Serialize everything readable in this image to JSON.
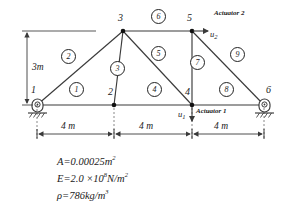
{
  "diagram": {
    "nodes": [
      {
        "id": "1",
        "label": "1",
        "x": 37,
        "y": 105,
        "support": "pin"
      },
      {
        "id": "2",
        "label": "2",
        "x": 114,
        "y": 105,
        "support": "none"
      },
      {
        "id": "3",
        "label": "3",
        "x": 123,
        "y": 31,
        "support": "none"
      },
      {
        "id": "4",
        "label": "4",
        "x": 192,
        "y": 105,
        "support": "none"
      },
      {
        "id": "5",
        "label": "5",
        "x": 192,
        "y": 31,
        "support": "none"
      },
      {
        "id": "6",
        "label": "6",
        "x": 264,
        "y": 105,
        "support": "roller"
      }
    ],
    "elements": [
      {
        "id": "1",
        "label": "1",
        "from": "1",
        "to": "2",
        "cx": 76,
        "cy": 89
      },
      {
        "id": "2",
        "label": "2",
        "from": "1",
        "to": "3",
        "cx": 68,
        "cy": 56
      },
      {
        "id": "3",
        "label": "3",
        "from": "2",
        "to": "3",
        "cx": 116,
        "cy": 68
      },
      {
        "id": "4",
        "label": "4",
        "from": "2",
        "to": "4",
        "cx": 154,
        "cy": 89
      },
      {
        "id": "5",
        "label": "5",
        "from": "3",
        "to": "4",
        "cx": 157,
        "cy": 53
      },
      {
        "id": "6",
        "label": "6",
        "from": "3",
        "to": "5",
        "cx": 157,
        "cy": 16
      },
      {
        "id": "7",
        "label": "7",
        "from": "4",
        "to": "5",
        "cx": 196,
        "cy": 62
      },
      {
        "id": "8",
        "label": "8",
        "from": "4",
        "to": "6",
        "cx": 226,
        "cy": 89
      },
      {
        "id": "9",
        "label": "9",
        "from": "5",
        "to": "6",
        "cx": 236,
        "cy": 54
      }
    ],
    "dimensions": {
      "height": {
        "label": "3m",
        "value": 3,
        "unit": "m"
      },
      "spans": [
        {
          "label": "4  m",
          "value": 4,
          "unit": "m"
        },
        {
          "label": "4  m",
          "value": 4,
          "unit": "m"
        },
        {
          "label": "4  m",
          "value": 4,
          "unit": "m"
        }
      ]
    },
    "actuators": [
      {
        "name": "Actuator 1",
        "label": "Actuator 1",
        "dof": "u",
        "dof_sub": "1",
        "node": "4",
        "direction": "down"
      },
      {
        "name": "Actuator 2",
        "label": "Actuator 2",
        "dof": "u",
        "dof_sub": "2",
        "node": "5",
        "direction": "right"
      }
    ],
    "properties": [
      {
        "symbol": "A",
        "eq": "=",
        "value": "0.00025",
        "unit": "m",
        "unit_exp": "2",
        "full": "A=0.00025m2"
      },
      {
        "symbol": "E",
        "eq": "=",
        "value": "2.0 ×10",
        "value_exp": "8",
        "unit": "N/m",
        "unit_exp": "2",
        "full": "E=2.0 x10^8 N/m2"
      },
      {
        "symbol": "ρ",
        "eq": "=",
        "value": "786",
        "unit": "kg/m",
        "unit_exp": "3",
        "full": "rho=786kg/m3"
      }
    ],
    "colors": {
      "line": "#3a3a3a",
      "node": "#111111",
      "text": "#1a1a1a",
      "background": "#ffffff"
    }
  }
}
